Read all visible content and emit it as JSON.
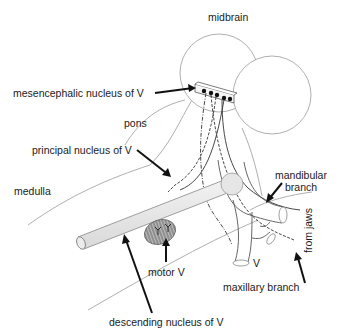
{
  "figure": {
    "labels": {
      "midbrain": "midbrain",
      "mesencephalic_nucleus": "mesencephalic nucleus of V",
      "pons": "pons",
      "principal_nucleus": "principal nucleus of V",
      "medulla": "medulla",
      "mandibular_branch_line1": "mandibular",
      "mandibular_branch_line2": "branch",
      "from_jaws": "from jaws",
      "motor_v": "motor V",
      "v": "V",
      "maxillary_branch": "maxillary branch",
      "descending_nucleus": "descending nucleus of V"
    },
    "colors": {
      "background": "#ffffff",
      "outline": "#9a9a9a",
      "pointer": "#111111",
      "nucleus_fill": "#e6e6e6",
      "motor_fill": "#888888"
    }
  }
}
